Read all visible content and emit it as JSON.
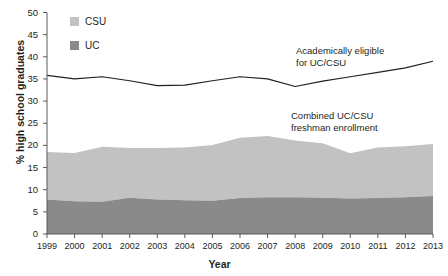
{
  "chart_data": {
    "type": "area",
    "title": "",
    "xlabel": "Year",
    "ylabel": "% high school graduates",
    "ylim": [
      0,
      50
    ],
    "yticks": [
      0,
      5,
      10,
      15,
      20,
      25,
      30,
      35,
      40,
      45,
      50
    ],
    "grid": false,
    "legend_position": "top-left",
    "categories": [
      1999,
      2000,
      2001,
      2002,
      2003,
      2004,
      2005,
      2006,
      2007,
      2008,
      2009,
      2010,
      2011,
      2012,
      2013
    ],
    "x_tick_labels": [
      "1999",
      "2000",
      "2001",
      "2002",
      "2003",
      "2004",
      "2005",
      "2006",
      "2007",
      "2008",
      "2009",
      "2010",
      "2011",
      "2012",
      "2013"
    ],
    "stacked": true,
    "series": [
      {
        "name": "UC",
        "kind": "stacked-area",
        "color": "#8a8a8a",
        "values": [
          7.8,
          7.4,
          7.3,
          8.2,
          7.8,
          7.6,
          7.5,
          8.1,
          8.3,
          8.3,
          8.2,
          8.0,
          8.1,
          8.3,
          8.6
        ]
      },
      {
        "name": "CSU",
        "kind": "stacked-area",
        "color": "#c2c2c2",
        "values": [
          10.7,
          10.9,
          12.4,
          11.2,
          11.6,
          11.9,
          12.6,
          13.6,
          13.8,
          12.8,
          12.3,
          10.2,
          11.4,
          11.5,
          11.7
        ]
      },
      {
        "name": "Academically eligible for UC/CSU",
        "kind": "line",
        "color": "#231f20",
        "values": [
          35.8,
          35.0,
          35.5,
          34.6,
          33.5,
          33.6,
          34.6,
          35.5,
          35.0,
          33.3,
          34.5,
          35.5,
          36.5,
          37.5,
          39.0
        ]
      }
    ],
    "combined_totals": [
      18.5,
      18.3,
      19.7,
      19.4,
      19.4,
      19.5,
      20.1,
      21.7,
      22.1,
      21.1,
      20.5,
      18.2,
      19.5,
      19.8,
      20.3
    ],
    "legend": [
      {
        "label": "CSU",
        "color": "#c2c2c2"
      },
      {
        "label": "UC",
        "color": "#8a8a8a"
      }
    ],
    "annotations": [
      {
        "name": "eligible-annotation",
        "text": "Academically eligible\nfor UC/CSU"
      },
      {
        "name": "enrollment-annotation",
        "text": "Combined UC/CSU\nfreshman enrollment"
      }
    ]
  },
  "colors": {
    "csu": "#c2c2c2",
    "uc": "#8a8a8a",
    "line": "#231f20",
    "axis": "#58595b",
    "text": "#231f20",
    "background": "#ffffff"
  }
}
